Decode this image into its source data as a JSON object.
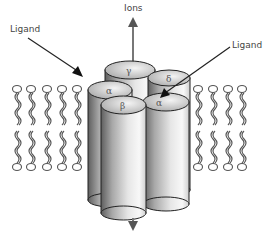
{
  "diagram": {
    "labels": {
      "ions": "Ions",
      "ligand_left": "Ligand",
      "ligand_right": "Ligand"
    },
    "subunits": [
      {
        "id": "gamma",
        "symbol": "γ"
      },
      {
        "id": "delta",
        "symbol": "δ"
      },
      {
        "id": "alpha_left",
        "symbol": "α"
      },
      {
        "id": "beta",
        "symbol": "β"
      },
      {
        "id": "alpha_right",
        "symbol": "α"
      }
    ],
    "colors": {
      "cylinder_light": "#f2f2f2",
      "cylinder_mid": "#bdbdbd",
      "cylinder_dark": "#6e6e6e",
      "outline": "#222222",
      "arrow": "#777777",
      "lipid": "#555555"
    },
    "lipid_columns_left": 5,
    "lipid_columns_right": 5
  }
}
